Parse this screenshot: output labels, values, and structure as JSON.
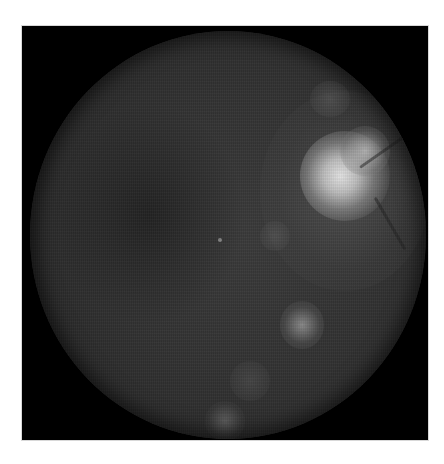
{
  "image": {
    "subject": "grayscale retinal fundus photograph",
    "background_color": "#000000",
    "page_color": "#ffffff",
    "features": [
      {
        "name": "optic-disc",
        "description": "bright spot, upper right"
      },
      {
        "name": "fovea-dot",
        "description": "small bright dot, center-left"
      },
      {
        "name": "bright-lesion",
        "description": "bright patch, lower center-right"
      },
      {
        "name": "bright-lesion",
        "description": "faint patch, bottom center"
      }
    ]
  }
}
